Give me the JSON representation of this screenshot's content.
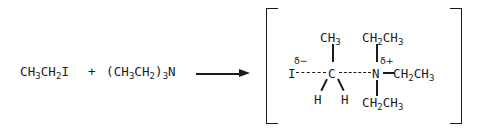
{
  "diagram": {
    "background_color": "#ffffff",
    "ink_color": "#1a1a1a"
  },
  "reaction": {
    "reactant_1": {
      "name": "iodoethane",
      "parts": [
        {
          "text": "CH",
          "type": "base"
        },
        {
          "text": "3",
          "type": "sub"
        },
        {
          "text": "CH",
          "type": "base"
        },
        {
          "text": "2",
          "type": "sub"
        },
        {
          "text": "I",
          "type": "base"
        }
      ]
    },
    "plus_sign": "+",
    "reactant_2": {
      "name": "triethylamine",
      "parts": [
        {
          "text": "(CH",
          "type": "base"
        },
        {
          "text": "3",
          "type": "sub"
        },
        {
          "text": "CH",
          "type": "base"
        },
        {
          "text": "2",
          "type": "sub"
        },
        {
          "text": ")",
          "type": "base"
        },
        {
          "text": "3",
          "type": "sub"
        },
        {
          "text": "N",
          "type": "base"
        }
      ]
    },
    "arrow": "reaction-arrow-right"
  },
  "transition_state": {
    "bracket_left": "[",
    "bracket_right": "]",
    "central_atoms": {
      "iodine": "I",
      "carbon": "C",
      "nitrogen": "N"
    },
    "partial_charges": {
      "iodine_charge": "δ−",
      "nitrogen_charge": "δ+"
    },
    "bonds": {
      "iodine_carbon": "partial-dashed",
      "carbon_nitrogen": "partial-dashed",
      "carbon_methyl": "solid",
      "carbon_hydrogen_left": "solid",
      "carbon_hydrogen_right": "solid",
      "nitrogen_ethyl_top": "solid",
      "nitrogen_ethyl_right": "solid",
      "nitrogen_ethyl_bottom": "solid"
    },
    "substituents": {
      "methyl": {
        "parts": [
          {
            "text": "CH",
            "type": "base"
          },
          {
            "text": "3",
            "type": "sub"
          }
        ]
      },
      "ethyl_top": {
        "parts": [
          {
            "text": "CH",
            "type": "base"
          },
          {
            "text": "2",
            "type": "sub"
          },
          {
            "text": "CH",
            "type": "base"
          },
          {
            "text": "3",
            "type": "sub"
          }
        ]
      },
      "ethyl_right": {
        "parts": [
          {
            "text": "CH",
            "type": "base"
          },
          {
            "text": "2",
            "type": "sub"
          },
          {
            "text": "CH",
            "type": "base"
          },
          {
            "text": "3",
            "type": "sub"
          }
        ]
      },
      "ethyl_bottom": {
        "parts": [
          {
            "text": "CH",
            "type": "base"
          },
          {
            "text": "2",
            "type": "sub"
          },
          {
            "text": "CH",
            "type": "base"
          },
          {
            "text": "3",
            "type": "sub"
          }
        ]
      },
      "hydrogen_left": "H",
      "hydrogen_right": "H"
    }
  }
}
